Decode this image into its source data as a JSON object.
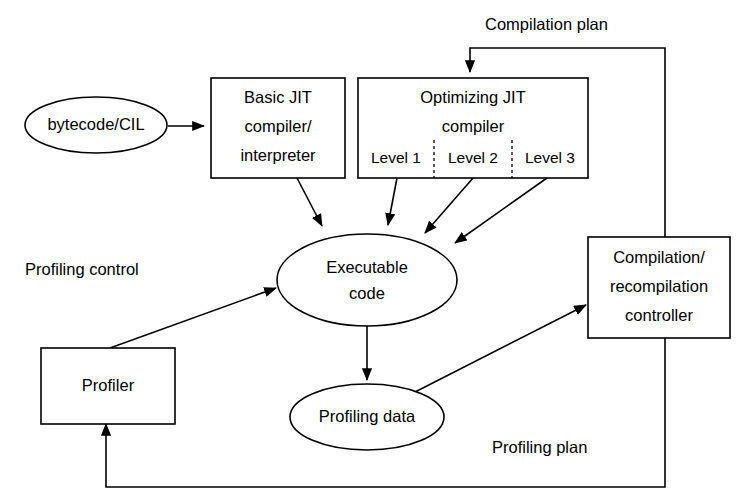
{
  "diagram": {
    "background_color": "#ffffff",
    "stroke_color": "#000000",
    "nodes": {
      "bytecode": {
        "label": "bytecode/CIL",
        "shape": "ellipse"
      },
      "basic_jit": {
        "shape": "rectangle",
        "line1": "Basic JIT",
        "line2": "compiler/",
        "line3": "interpreter"
      },
      "optimizing_jit": {
        "shape": "rectangle",
        "line1": "Optimizing JIT",
        "line2": "compiler",
        "levels": [
          "Level 1",
          "Level 2",
          "Level 3"
        ]
      },
      "executable_code": {
        "shape": "ellipse",
        "line1": "Executable",
        "line2": "code"
      },
      "controller": {
        "shape": "rectangle",
        "line1": "Compilation/",
        "line2": "recompilation",
        "line3": "controller"
      },
      "profiler": {
        "label": "Profiler",
        "shape": "rectangle"
      },
      "profiling_data": {
        "label": "Profiling data",
        "shape": "ellipse"
      }
    },
    "edge_labels": {
      "compilation_plan": "Compilation plan",
      "profiling_control": "Profiling control",
      "profiling_plan": "Profiling plan"
    }
  }
}
